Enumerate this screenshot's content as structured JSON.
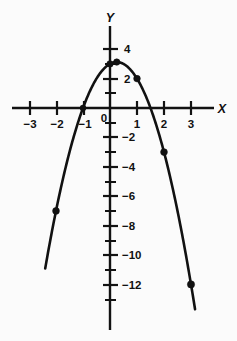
{
  "chart_data": {
    "type": "line",
    "title": "",
    "subtitle": "",
    "xlabel": "X",
    "ylabel": "Y",
    "xlim": [
      -3.6,
      3.6
    ],
    "ylim": [
      -13.2,
      4.6
    ],
    "grid": false,
    "legend": null,
    "function": "y = -2x^2 + x + 3",
    "x_ticks_major": [
      -3,
      -2,
      -1,
      1,
      2,
      3
    ],
    "x_tick_labels": [
      "−3",
      "−2",
      "−1",
      "1",
      "2",
      "3"
    ],
    "y_ticks_major": [
      4,
      2,
      -2,
      -4,
      -6,
      -8,
      -10,
      -12
    ],
    "y_tick_labels": [
      "4",
      "2",
      "−2",
      "−4",
      "−6",
      "−8",
      "−10",
      "−12"
    ],
    "y_ticks_minor": [
      3,
      1,
      -1,
      -3,
      -5,
      -7,
      -9,
      -11,
      -13
    ],
    "origin_label": "0",
    "points": [
      {
        "x": -2,
        "y": -7
      },
      {
        "x": -1,
        "y": 0
      },
      {
        "x": 0,
        "y": 3
      },
      {
        "x": 0.25,
        "y": 3.125
      },
      {
        "x": 1,
        "y": 2
      },
      {
        "x": 2,
        "y": -3
      },
      {
        "x": 3,
        "y": -12
      }
    ],
    "curve_x_range": [
      -2.4,
      3.15
    ],
    "vertex": {
      "x": 0.25,
      "y": 3.125
    }
  }
}
